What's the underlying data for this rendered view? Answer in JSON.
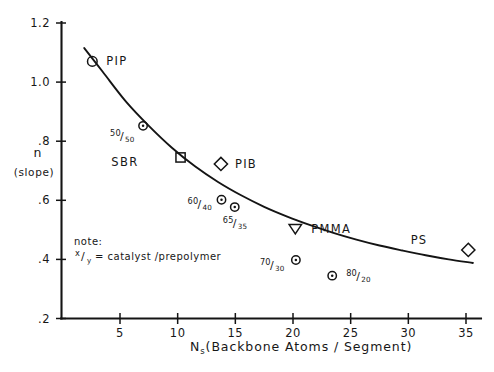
{
  "chart_data": {
    "type": "scatter",
    "title": "",
    "xlabel": "Nₛ (Backbone Atoms / Segment)",
    "xlabel_main": "N",
    "xlabel_sub": "s",
    "xlabel_rest": "(Backbone Atoms / Segment)",
    "ylabel": "n",
    "ylabel_sub": "(slope)",
    "xlim": [
      0,
      37
    ],
    "ylim": [
      0.2,
      1.2
    ],
    "grid": false,
    "legend": "none",
    "xticks": [
      5,
      10,
      15,
      20,
      25,
      30,
      35
    ],
    "xticklabels": [
      "5",
      "10",
      "15",
      "20",
      "25",
      "30",
      "35"
    ],
    "yticks": [
      1.2,
      1.0,
      0.8,
      0.6,
      0.4,
      0.2
    ],
    "yticklabels": [
      "1.2",
      "1.0",
      ".8",
      ".6",
      ".4",
      ".2"
    ],
    "points": [
      {
        "name": "PIP",
        "marker": "circle",
        "x": 2.6,
        "y": 1.07,
        "label": "PIP",
        "label_dx": 14,
        "label_dy": 4
      },
      {
        "name": "50/50",
        "marker": "circle-dot",
        "x": 7.0,
        "y": 0.852,
        "label": "",
        "ratio_num": "50",
        "ratio_den": "50",
        "ratio_dx": -33,
        "ratio_dy": 10
      },
      {
        "name": "SBR",
        "marker": "square",
        "x": 10.25,
        "y": 0.745,
        "label": "",
        "label_dx": 0,
        "label_dy": 0
      },
      {
        "name": "PIB",
        "marker": "diamond",
        "x": 13.75,
        "y": 0.723,
        "label": "PIB",
        "label_dx": 14,
        "label_dy": 4
      },
      {
        "name": "60/40",
        "marker": "circle-dot",
        "x": 13.8,
        "y": 0.602,
        "label": "",
        "ratio_num": "60",
        "ratio_den": "40",
        "ratio_dx": -34,
        "ratio_dy": 4
      },
      {
        "name": "65/35",
        "marker": "circle-dot",
        "x": 14.95,
        "y": 0.577,
        "label": "",
        "ratio_num": "65",
        "ratio_den": "35",
        "ratio_dx": -12,
        "ratio_dy": 16
      },
      {
        "name": "PMMA",
        "marker": "triangle-down",
        "x": 20.2,
        "y": 0.502,
        "label": "PMMA",
        "label_dx": 16,
        "label_dy": 4
      },
      {
        "name": "70/30",
        "marker": "circle-dot",
        "x": 20.25,
        "y": 0.398,
        "label": "",
        "ratio_num": "70",
        "ratio_den": "30",
        "ratio_dx": -36,
        "ratio_dy": 5
      },
      {
        "name": "80/20",
        "marker": "circle-dot",
        "x": 23.4,
        "y": 0.345,
        "label": "",
        "ratio_num": "80",
        "ratio_den": "20",
        "ratio_dx": 14,
        "ratio_dy": 0
      },
      {
        "name": "PS",
        "marker": "diamond",
        "x": 35.2,
        "y": 0.432,
        "label": "",
        "label_dx": 0,
        "label_dy": 0
      }
    ],
    "annotations": [
      {
        "name": "SBR",
        "text": "SBR",
        "x": 4.25,
        "y": 0.715
      },
      {
        "name": "PS",
        "text": "PS",
        "x": 30.2,
        "y": 0.452
      }
    ],
    "note": {
      "line1": "note:",
      "ratio_num": "x",
      "ratio_den": "y",
      "line2_rest": "= catalyst /prepolymer"
    },
    "curve": {
      "description": "smooth monotonic decreasing curve fitted through data",
      "x": [
        1.9,
        3.5,
        5.5,
        7.5,
        9.5,
        11.5,
        13.5,
        15.5,
        17.5,
        19.5,
        21.5,
        23.5,
        25.5,
        27.5,
        29.5,
        31.5,
        33.5,
        35.6
      ],
      "y": [
        1.115,
        1.035,
        0.935,
        0.852,
        0.778,
        0.715,
        0.662,
        0.617,
        0.578,
        0.545,
        0.516,
        0.49,
        0.467,
        0.447,
        0.43,
        0.414,
        0.4,
        0.388
      ]
    }
  },
  "colors": {
    "ink": "#141414",
    "background": "#ffffff"
  }
}
